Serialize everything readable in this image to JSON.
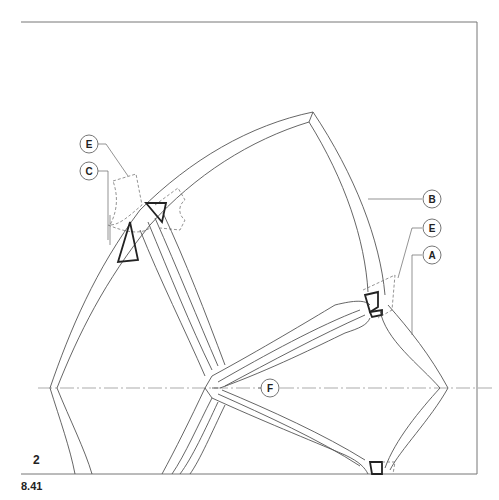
{
  "figure": {
    "panel_number": "2",
    "figure_reference": "8.41"
  },
  "callouts": [
    {
      "label": "E",
      "id": "E-left"
    },
    {
      "label": "C",
      "id": "C"
    },
    {
      "label": "B",
      "id": "B"
    },
    {
      "label": "E",
      "id": "E-right"
    },
    {
      "label": "A",
      "id": "A"
    },
    {
      "label": "F",
      "id": "F"
    }
  ],
  "colors": {
    "line": "#555555",
    "bold_line": "#222222",
    "background": "#ffffff"
  }
}
